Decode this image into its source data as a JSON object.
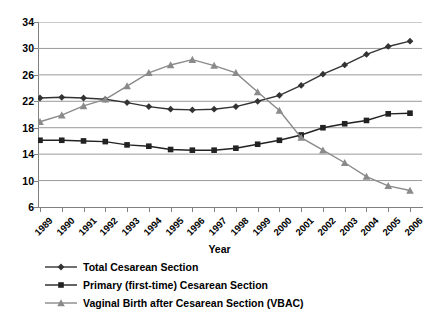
{
  "chart_data": {
    "type": "line",
    "title": "",
    "xlabel": "Year",
    "ylabel": "",
    "grid": true,
    "legend_position": "bottom-left",
    "x": [
      1989,
      1990,
      1991,
      1992,
      1993,
      1994,
      1995,
      1996,
      1997,
      1998,
      1999,
      2000,
      2001,
      2002,
      2003,
      2004,
      2005,
      2006
    ],
    "categories": [
      "1989",
      "1990",
      "1991",
      "1992",
      "1993",
      "1994",
      "1995",
      "1996",
      "1997",
      "1998",
      "1999",
      "2000",
      "2001",
      "2002",
      "2003",
      "2004",
      "2005",
      "2006"
    ],
    "xlim": [
      1989,
      2006
    ],
    "ylim": [
      6,
      34
    ],
    "yticks": [
      6,
      10,
      14,
      18,
      22,
      26,
      30,
      34
    ],
    "series": [
      {
        "name": "Total Cesarean Section",
        "marker": "diamond",
        "color": "#333333",
        "values": [
          22.5,
          22.6,
          22.5,
          22.3,
          21.8,
          21.2,
          20.8,
          20.7,
          20.8,
          21.2,
          22.0,
          22.9,
          24.4,
          26.1,
          27.5,
          29.1,
          30.3,
          31.1
        ]
      },
      {
        "name": "Primary (first-time) Cesarean Section",
        "marker": "square",
        "color": "#222222",
        "values": [
          16.1,
          16.1,
          16.0,
          15.9,
          15.4,
          15.2,
          14.7,
          14.6,
          14.6,
          14.9,
          15.5,
          16.1,
          16.9,
          18.0,
          18.6,
          19.1,
          20.1,
          20.2
        ]
      },
      {
        "name": "Vaginal Birth after Cesarean Section (VBAC)",
        "marker": "triangle",
        "color": "#8a8a8a",
        "values": [
          18.9,
          19.9,
          21.3,
          22.3,
          24.3,
          26.3,
          27.5,
          28.3,
          27.4,
          26.3,
          23.4,
          20.6,
          16.5,
          14.6,
          12.7,
          10.6,
          9.2,
          8.5
        ]
      }
    ]
  },
  "legend": {
    "items": [
      {
        "label": "Total Cesarean Section"
      },
      {
        "label": "Primary (first-time) Cesarean Section"
      },
      {
        "label": "Vaginal Birth after Cesarean Section (VBAC)"
      }
    ]
  },
  "axis": {
    "x_title": "Year"
  }
}
